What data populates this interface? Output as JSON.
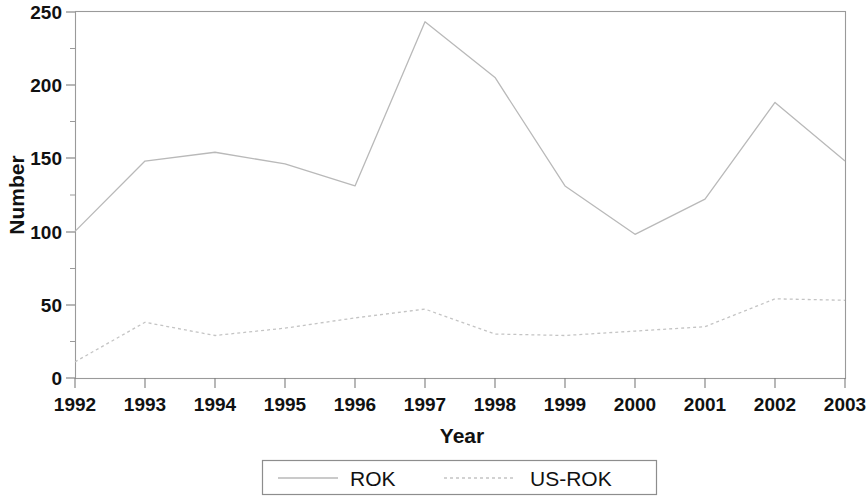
{
  "chart_data": {
    "type": "line",
    "title": "",
    "xlabel": "Year",
    "ylabel": "Number",
    "categories": [
      "1992",
      "1993",
      "1994",
      "1995",
      "1996",
      "1997",
      "1998",
      "1999",
      "2000",
      "2001",
      "2002",
      "2003"
    ],
    "x": [
      1992,
      1993,
      1994,
      1995,
      1996,
      1997,
      1998,
      1999,
      2000,
      2001,
      2002,
      2003
    ],
    "xlim": [
      1992,
      2003
    ],
    "ylim": [
      0,
      250
    ],
    "yticks": [
      0,
      50,
      100,
      150,
      200,
      250
    ],
    "ytick_labels": [
      "0",
      "50",
      "100",
      "150",
      "200",
      "250"
    ],
    "xtick_labels": [
      "1992",
      "1993",
      "1994",
      "1995",
      "1996",
      "1997",
      "1998",
      "1999",
      "2000",
      "2001",
      "2002",
      "2003"
    ],
    "grid": false,
    "legend_position": "below-plot",
    "series": [
      {
        "name": "ROK",
        "style": "solid",
        "color": "#b9b9b9",
        "values": [
          100,
          148,
          154,
          146,
          131,
          243,
          205,
          131,
          98,
          122,
          188,
          148
        ]
      },
      {
        "name": "US-ROK",
        "style": "dotted",
        "color": "#c4c4c4",
        "values": [
          11,
          38,
          29,
          34,
          41,
          47,
          30,
          29,
          32,
          35,
          54,
          53
        ]
      }
    ]
  },
  "axes": {
    "y_title": "Number",
    "x_title": "Year"
  },
  "legend": {
    "entries": [
      {
        "label": "ROK"
      },
      {
        "label": "US-ROK"
      }
    ]
  }
}
